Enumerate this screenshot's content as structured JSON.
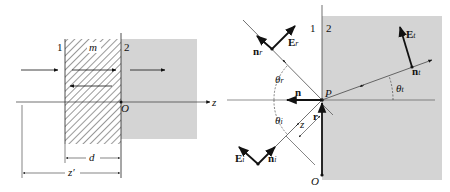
{
  "left_figure": {
    "region_labels": {
      "region1": "1",
      "region2": "2"
    },
    "layer_label": "m",
    "axis_label": "z",
    "origin_label": "O",
    "dimension_d": "d",
    "dimension_z_prime": "z′",
    "colors": {
      "medium2_fill": "#d4d4d4",
      "hatch": "#333333",
      "line": "#222222"
    }
  },
  "right_figure": {
    "region_labels": {
      "region1": "1",
      "region2": "2"
    },
    "point_label": "P",
    "origin_label": "O",
    "normal_label": "n",
    "position_vector_label": "r",
    "distance_label": "z",
    "incident": {
      "field": "E",
      "field_sub": "i",
      "dir": "n",
      "dir_sub": "i",
      "angle": "θ",
      "angle_sub": "i"
    },
    "reflected": {
      "field": "E",
      "field_sub": "r",
      "dir": "n",
      "dir_sub": "r",
      "angle": "θ",
      "angle_sub": "r"
    },
    "transmitted": {
      "field": "E",
      "field_sub": "t",
      "dir": "n",
      "dir_sub": "t",
      "angle": "θ",
      "angle_sub": "t"
    },
    "colors": {
      "medium2_fill": "#d4d4d4",
      "line": "#222222"
    }
  }
}
